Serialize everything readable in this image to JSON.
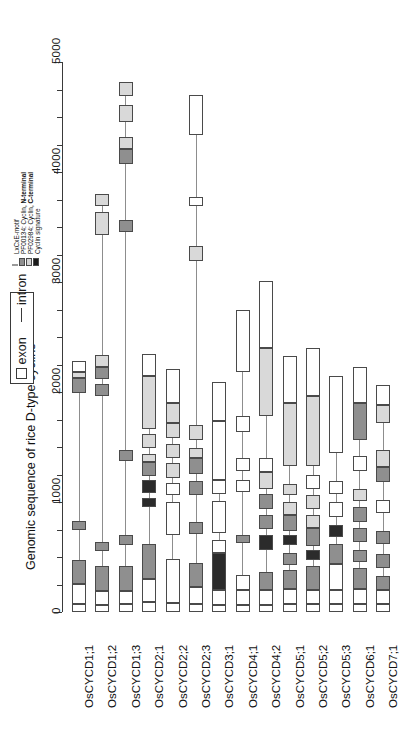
{
  "figure": {
    "axis_title": "Genomic sequence of rice D-type cyclins",
    "axis_ticks_labeled": [
      "0",
      "1000",
      "2000",
      "3000",
      "4000",
      "5000"
    ],
    "axis_min": 0,
    "axis_max": 5000,
    "minor_tick_step": 250
  },
  "legend_structure": {
    "exon_label": "exon",
    "intron_label": "intron",
    "exon_icon": "open-rectangle-icon",
    "intron_icon": "horizontal-line-icon"
  },
  "legend_domains": {
    "items": [
      {
        "label": "LxCxE-motif",
        "color": "#ffffff",
        "swatch": "thin-line-swatch"
      },
      {
        "label_pre": "PF00134: Cyclin, ",
        "label_bold": "N-terminal",
        "color": "#8f8f8f",
        "swatch": "mid-gray-swatch"
      },
      {
        "label_pre": "PF02984: Cyclin, ",
        "label_bold": "C-terminal",
        "color": "#d4d4d4",
        "swatch": "light-gray-swatch"
      },
      {
        "label": "Cyclin signature",
        "color": "#1a1a1a",
        "swatch": "black-swatch"
      }
    ]
  },
  "colors": {
    "exon_fill": "#ffffff",
    "n_terminal": "#8f8f8f",
    "c_terminal": "#d9d9d9",
    "signature": "#2b2b2b",
    "lxcxe": "#ffffff",
    "outline": "#4a4a4a",
    "intron": "#8d8d8d",
    "axis": "#3a3a3a"
  },
  "chart_data": {
    "type": "gene-structure-diagram",
    "title": "Genomic sequence of rice D-type cyclins",
    "xlabel": "",
    "ylabel": "Genomic sequence of rice D-type cyclins",
    "ylim": [
      0,
      5000
    ],
    "grid": false,
    "legend_position": "top-left",
    "categories": [
      "OsCYCD1;1",
      "OsCYCD1;2",
      "OsCYCD1;3",
      "OsCYCD2;1",
      "OsCYCD2;2",
      "OsCYCD2;3",
      "OsCYCD3;1",
      "OsCYCD4;1",
      "OsCYCD4;2",
      "OsCYCD5;1",
      "OsCYCD5;2",
      "OsCYCD5;3",
      "OsCYCD6;1",
      "OsCYCD7;1"
    ],
    "genes": [
      {
        "name": "OsCYCD1;1",
        "length": 2280,
        "features": [
          {
            "start": 0,
            "end": 75,
            "type": "exon"
          },
          {
            "start": 75,
            "end": 250,
            "type": "exon"
          },
          {
            "start": 250,
            "end": 470,
            "type": "n_terminal"
          },
          {
            "start": 745,
            "end": 830,
            "type": "n_terminal"
          },
          {
            "start": 1990,
            "end": 2130,
            "type": "n_terminal"
          },
          {
            "start": 2130,
            "end": 2180,
            "type": "c_terminal"
          },
          {
            "start": 2180,
            "end": 2280,
            "type": "exon"
          }
        ]
      },
      {
        "name": "OsCYCD1;2",
        "length": 3800,
        "features": [
          {
            "start": 0,
            "end": 60,
            "type": "exon"
          },
          {
            "start": 60,
            "end": 190,
            "type": "exon"
          },
          {
            "start": 190,
            "end": 420,
            "type": "n_terminal"
          },
          {
            "start": 555,
            "end": 640,
            "type": "n_terminal"
          },
          {
            "start": 1960,
            "end": 2070,
            "type": "n_terminal"
          },
          {
            "start": 2115,
            "end": 2230,
            "type": "n_terminal"
          },
          {
            "start": 2230,
            "end": 2340,
            "type": "c_terminal"
          },
          {
            "start": 3430,
            "end": 3640,
            "type": "c_terminal"
          },
          {
            "start": 3690,
            "end": 3800,
            "type": "c_terminal"
          }
        ]
      },
      {
        "name": "OsCYCD1;3",
        "length": 4820,
        "features": [
          {
            "start": 0,
            "end": 70,
            "type": "exon"
          },
          {
            "start": 70,
            "end": 195,
            "type": "exon"
          },
          {
            "start": 195,
            "end": 420,
            "type": "n_terminal"
          },
          {
            "start": 610,
            "end": 700,
            "type": "n_terminal"
          },
          {
            "start": 1370,
            "end": 1470,
            "type": "n_terminal"
          },
          {
            "start": 3450,
            "end": 3560,
            "type": "n_terminal"
          },
          {
            "start": 4070,
            "end": 4210,
            "type": "n_terminal"
          },
          {
            "start": 4210,
            "end": 4320,
            "type": "c_terminal"
          },
          {
            "start": 4450,
            "end": 4610,
            "type": "c_terminal"
          },
          {
            "start": 4690,
            "end": 4820,
            "type": "c_terminal"
          }
        ]
      },
      {
        "name": "OsCYCD2;1",
        "length": 2350,
        "features": [
          {
            "start": 0,
            "end": 90,
            "type": "exon"
          },
          {
            "start": 90,
            "end": 300,
            "type": "exon"
          },
          {
            "start": 300,
            "end": 620,
            "type": "n_terminal"
          },
          {
            "start": 955,
            "end": 1040,
            "type": "signature"
          },
          {
            "start": 1080,
            "end": 1200,
            "type": "signature"
          },
          {
            "start": 1235,
            "end": 1360,
            "type": "n_terminal"
          },
          {
            "start": 1360,
            "end": 1440,
            "type": "c_terminal"
          },
          {
            "start": 1490,
            "end": 1620,
            "type": "c_terminal"
          },
          {
            "start": 1660,
            "end": 2150,
            "type": "c_terminal"
          },
          {
            "start": 2150,
            "end": 2350,
            "type": "exon"
          }
        ]
      },
      {
        "name": "OsCYCD2;2",
        "length": 2210,
        "features": [
          {
            "start": 0,
            "end": 80,
            "type": "exon"
          },
          {
            "start": 80,
            "end": 480,
            "type": "exon"
          },
          {
            "start": 700,
            "end": 1000,
            "type": "exon"
          },
          {
            "start": 1060,
            "end": 1170,
            "type": "exon"
          },
          {
            "start": 1220,
            "end": 1350,
            "type": "c_terminal"
          },
          {
            "start": 1400,
            "end": 1530,
            "type": "c_terminal"
          },
          {
            "start": 1580,
            "end": 1720,
            "type": "c_terminal"
          },
          {
            "start": 1720,
            "end": 1900,
            "type": "c_terminal"
          },
          {
            "start": 1900,
            "end": 2210,
            "type": "exon"
          }
        ]
      },
      {
        "name": "OsCYCD2;3",
        "length": 4700,
        "features": [
          {
            "start": 0,
            "end": 70,
            "type": "exon"
          },
          {
            "start": 70,
            "end": 230,
            "type": "exon"
          },
          {
            "start": 230,
            "end": 450,
            "type": "n_terminal"
          },
          {
            "start": 710,
            "end": 820,
            "type": "n_terminal"
          },
          {
            "start": 1060,
            "end": 1190,
            "type": "n_terminal"
          },
          {
            "start": 1255,
            "end": 1400,
            "type": "n_terminal"
          },
          {
            "start": 1400,
            "end": 1490,
            "type": "c_terminal"
          },
          {
            "start": 1560,
            "end": 1700,
            "type": "c_terminal"
          },
          {
            "start": 3190,
            "end": 3330,
            "type": "c_terminal"
          },
          {
            "start": 3690,
            "end": 3770,
            "type": "exon"
          },
          {
            "start": 4340,
            "end": 4700,
            "type": "exon"
          }
        ]
      },
      {
        "name": "OsCYCD3;1",
        "length": 2090,
        "features": [
          {
            "start": 0,
            "end": 65,
            "type": "exon"
          },
          {
            "start": 65,
            "end": 200,
            "type": "exon"
          },
          {
            "start": 200,
            "end": 540,
            "type": "signature"
          },
          {
            "start": 540,
            "end": 650,
            "type": "exon"
          },
          {
            "start": 720,
            "end": 1010,
            "type": "exon"
          },
          {
            "start": 1070,
            "end": 1200,
            "type": "exon"
          },
          {
            "start": 1200,
            "end": 1740,
            "type": "exon"
          },
          {
            "start": 1740,
            "end": 2090,
            "type": "exon"
          }
        ]
      },
      {
        "name": "OsCYCD4;1",
        "length": 2750,
        "features": [
          {
            "start": 0,
            "end": 60,
            "type": "exon"
          },
          {
            "start": 60,
            "end": 200,
            "type": "exon"
          },
          {
            "start": 200,
            "end": 340,
            "type": "exon"
          },
          {
            "start": 630,
            "end": 700,
            "type": "n_terminal"
          },
          {
            "start": 1090,
            "end": 1200,
            "type": "exon"
          },
          {
            "start": 1280,
            "end": 1400,
            "type": "exon"
          },
          {
            "start": 1640,
            "end": 1780,
            "type": "exon"
          },
          {
            "start": 2180,
            "end": 2750,
            "type": "exon"
          }
        ]
      },
      {
        "name": "OsCYCD4;2",
        "length": 3010,
        "features": [
          {
            "start": 0,
            "end": 60,
            "type": "exon"
          },
          {
            "start": 60,
            "end": 200,
            "type": "exon"
          },
          {
            "start": 200,
            "end": 360,
            "type": "n_terminal"
          },
          {
            "start": 560,
            "end": 700,
            "type": "signature"
          },
          {
            "start": 750,
            "end": 880,
            "type": "n_terminal"
          },
          {
            "start": 940,
            "end": 1070,
            "type": "n_terminal"
          },
          {
            "start": 1120,
            "end": 1270,
            "type": "c_terminal"
          },
          {
            "start": 1270,
            "end": 1400,
            "type": "exon"
          },
          {
            "start": 1780,
            "end": 2400,
            "type": "c_terminal"
          },
          {
            "start": 2400,
            "end": 3010,
            "type": "exon"
          }
        ]
      },
      {
        "name": "OsCYCD5;1",
        "length": 2330,
        "features": [
          {
            "start": 0,
            "end": 70,
            "type": "exon"
          },
          {
            "start": 70,
            "end": 210,
            "type": "exon"
          },
          {
            "start": 210,
            "end": 380,
            "type": "n_terminal"
          },
          {
            "start": 430,
            "end": 540,
            "type": "n_terminal"
          },
          {
            "start": 610,
            "end": 700,
            "type": "signature"
          },
          {
            "start": 740,
            "end": 880,
            "type": "n_terminal"
          },
          {
            "start": 880,
            "end": 1000,
            "type": "c_terminal"
          },
          {
            "start": 1060,
            "end": 1160,
            "type": "c_terminal"
          },
          {
            "start": 1330,
            "end": 1900,
            "type": "c_terminal"
          },
          {
            "start": 1900,
            "end": 2330,
            "type": "exon"
          }
        ]
      },
      {
        "name": "OsCYCD5;2",
        "length": 2400,
        "features": [
          {
            "start": 0,
            "end": 70,
            "type": "exon"
          },
          {
            "start": 70,
            "end": 200,
            "type": "exon"
          },
          {
            "start": 200,
            "end": 420,
            "type": "n_terminal"
          },
          {
            "start": 470,
            "end": 560,
            "type": "signature"
          },
          {
            "start": 600,
            "end": 760,
            "type": "n_terminal"
          },
          {
            "start": 760,
            "end": 880,
            "type": "c_terminal"
          },
          {
            "start": 940,
            "end": 1060,
            "type": "c_terminal"
          },
          {
            "start": 1120,
            "end": 1250,
            "type": "exon"
          },
          {
            "start": 1330,
            "end": 1960,
            "type": "c_terminal"
          },
          {
            "start": 1960,
            "end": 2400,
            "type": "exon"
          }
        ]
      },
      {
        "name": "OsCYCD5;3",
        "length": 2150,
        "features": [
          {
            "start": 0,
            "end": 70,
            "type": "exon"
          },
          {
            "start": 70,
            "end": 200,
            "type": "exon"
          },
          {
            "start": 200,
            "end": 440,
            "type": "exon"
          },
          {
            "start": 440,
            "end": 620,
            "type": "n_terminal"
          },
          {
            "start": 680,
            "end": 790,
            "type": "signature"
          },
          {
            "start": 860,
            "end": 1000,
            "type": "exon"
          },
          {
            "start": 1070,
            "end": 1190,
            "type": "exon"
          },
          {
            "start": 1450,
            "end": 2150,
            "type": "exon"
          }
        ]
      },
      {
        "name": "OsCYCD6;1",
        "length": 2230,
        "features": [
          {
            "start": 0,
            "end": 70,
            "type": "exon"
          },
          {
            "start": 70,
            "end": 210,
            "type": "exon"
          },
          {
            "start": 210,
            "end": 400,
            "type": "n_terminal"
          },
          {
            "start": 450,
            "end": 560,
            "type": "n_terminal"
          },
          {
            "start": 640,
            "end": 760,
            "type": "n_terminal"
          },
          {
            "start": 820,
            "end": 950,
            "type": "n_terminal"
          },
          {
            "start": 1010,
            "end": 1120,
            "type": "c_terminal"
          },
          {
            "start": 1280,
            "end": 1420,
            "type": "exon"
          },
          {
            "start": 1560,
            "end": 1900,
            "type": "n_terminal"
          },
          {
            "start": 1900,
            "end": 2230,
            "type": "exon"
          }
        ]
      },
      {
        "name": "OsCYCD7;1",
        "length": 2060,
        "features": [
          {
            "start": 0,
            "end": 70,
            "type": "exon"
          },
          {
            "start": 70,
            "end": 200,
            "type": "exon"
          },
          {
            "start": 200,
            "end": 330,
            "type": "n_terminal"
          },
          {
            "start": 400,
            "end": 530,
            "type": "n_terminal"
          },
          {
            "start": 620,
            "end": 740,
            "type": "n_terminal"
          },
          {
            "start": 900,
            "end": 1020,
            "type": "exon"
          },
          {
            "start": 1180,
            "end": 1320,
            "type": "n_terminal"
          },
          {
            "start": 1320,
            "end": 1470,
            "type": "c_terminal"
          },
          {
            "start": 1720,
            "end": 1880,
            "type": "c_terminal"
          },
          {
            "start": 1880,
            "end": 2060,
            "type": "exon"
          }
        ]
      }
    ]
  }
}
